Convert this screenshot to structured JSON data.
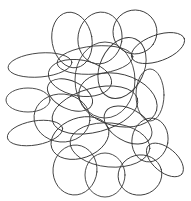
{
  "figure": {
    "background": "#ffffff",
    "stroke_color": "#3a3a3a",
    "stroke_width": 0.9,
    "loops": [
      {
        "cx": 72,
        "cy": 40,
        "rx": 20,
        "ry": 28,
        "rot": -10
      },
      {
        "cx": 100,
        "cy": 38,
        "rx": 22,
        "ry": 26,
        "rot": 10
      },
      {
        "cx": 135,
        "cy": 32,
        "rx": 22,
        "ry": 22,
        "rot": 35
      },
      {
        "cx": 158,
        "cy": 48,
        "rx": 28,
        "ry": 13,
        "rot": -20
      },
      {
        "cx": 40,
        "cy": 65,
        "rx": 32,
        "ry": 12,
        "rot": -5
      },
      {
        "cx": 28,
        "cy": 100,
        "rx": 22,
        "ry": 12,
        "rot": 0
      },
      {
        "cx": 35,
        "cy": 133,
        "rx": 28,
        "ry": 12,
        "rot": -10
      },
      {
        "cx": 62,
        "cy": 118,
        "rx": 28,
        "ry": 24,
        "rot": 5
      },
      {
        "cx": 80,
        "cy": 78,
        "rx": 32,
        "ry": 18,
        "rot": 10
      },
      {
        "cx": 105,
        "cy": 80,
        "rx": 30,
        "ry": 38,
        "rot": 0
      },
      {
        "cx": 118,
        "cy": 100,
        "rx": 40,
        "ry": 26,
        "rot": 15
      },
      {
        "cx": 95,
        "cy": 110,
        "rx": 44,
        "ry": 22,
        "rot": -15
      },
      {
        "cx": 122,
        "cy": 68,
        "rx": 22,
        "ry": 32,
        "rot": 25
      },
      {
        "cx": 150,
        "cy": 95,
        "rx": 14,
        "ry": 26,
        "rot": 0
      },
      {
        "cx": 150,
        "cy": 140,
        "rx": 18,
        "ry": 22,
        "rot": 10
      },
      {
        "cx": 165,
        "cy": 160,
        "rx": 22,
        "ry": 12,
        "rot": 40
      },
      {
        "cx": 75,
        "cy": 170,
        "rx": 22,
        "ry": 25,
        "rot": 5
      },
      {
        "cx": 105,
        "cy": 175,
        "rx": 20,
        "ry": 22,
        "rot": 0
      },
      {
        "cx": 140,
        "cy": 175,
        "rx": 22,
        "ry": 20,
        "rot": -15
      },
      {
        "cx": 110,
        "cy": 145,
        "rx": 40,
        "ry": 22,
        "rot": 5
      },
      {
        "cx": 80,
        "cy": 138,
        "rx": 30,
        "ry": 20,
        "rot": -20
      },
      {
        "cx": 128,
        "cy": 125,
        "rx": 26,
        "ry": 16,
        "rot": 30
      },
      {
        "cx": 70,
        "cy": 95,
        "rx": 24,
        "ry": 14,
        "rot": 25
      },
      {
        "cx": 95,
        "cy": 60,
        "rx": 38,
        "ry": 14,
        "rot": -5
      }
    ]
  }
}
